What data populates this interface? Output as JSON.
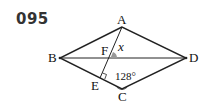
{
  "problem_number": "095",
  "diagram": {
    "shape": "rhombus ABCD with diagonal BD, segment AE perpendicular to BC intersecting BD at F",
    "points": {
      "A": "A",
      "B": "B",
      "C": "C",
      "D": "D",
      "E": "E",
      "F": "F"
    },
    "angle_label_c": "128°",
    "unknown_angle": "x",
    "marks": [
      "right angle at E",
      "angle x at F (shaded)",
      "angle 128° at C"
    ]
  }
}
